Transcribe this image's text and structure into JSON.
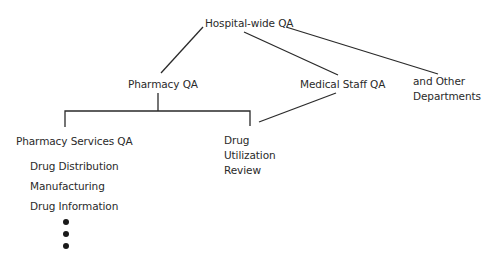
{
  "diagram": {
    "type": "org-chart",
    "nodes": {
      "root": {
        "label": "Hospital-wide QA"
      },
      "pharmacy": {
        "label": "Pharmacy QA"
      },
      "medical_staff": {
        "label": "Medical Staff QA"
      },
      "other": {
        "line1": "and Other",
        "line2": "Departments"
      },
      "pharmacy_services": {
        "label": "Pharmacy Services QA"
      },
      "dur": {
        "line1": "Drug",
        "line2": "Utilization",
        "line3": "Review"
      }
    },
    "pharmacy_services_items": [
      "Drug Distribution",
      "Manufacturing",
      "Drug Information"
    ],
    "continuation": "more items (vertical ellipsis)",
    "edges": [
      [
        "Hospital-wide QA",
        "Pharmacy QA"
      ],
      [
        "Hospital-wide QA",
        "Medical Staff QA"
      ],
      [
        "Hospital-wide QA",
        "and Other Departments"
      ],
      [
        "Pharmacy QA",
        "Pharmacy Services QA"
      ],
      [
        "Pharmacy QA",
        "Drug Utilization Review"
      ],
      [
        "Medical Staff QA",
        "Drug Utilization Review"
      ]
    ],
    "colors": {
      "line": "#2a2a2a",
      "text": "#2a2a2a",
      "background": "#ffffff"
    }
  }
}
